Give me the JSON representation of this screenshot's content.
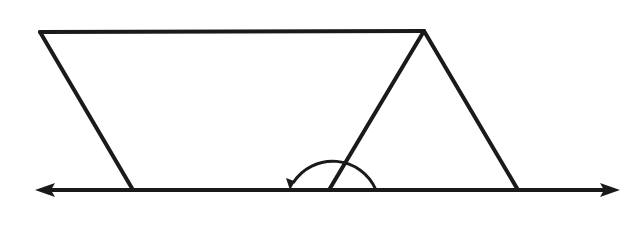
{
  "diagram": {
    "title": "",
    "stroke_color": "#1a1a1a",
    "background_color": "#ffffff",
    "stroke_width": 4,
    "baseline": {
      "type": "line-with-arrows-both-ends",
      "y": 190,
      "x_start": 35,
      "x_end": 620
    },
    "points": {
      "top_left": [
        40,
        32
      ],
      "top_right_apex": [
        424,
        31
      ],
      "base_left": [
        133,
        190
      ],
      "base_middle": [
        329,
        190
      ],
      "base_right": [
        518,
        190
      ]
    },
    "segments": [
      {
        "name": "top-edge",
        "from": "top_left",
        "to": "top_right_apex"
      },
      {
        "name": "left-edge",
        "from": "top_left",
        "to": "base_left"
      },
      {
        "name": "middle-edge",
        "from": "top_right_apex",
        "to": "base_middle"
      },
      {
        "name": "right-edge",
        "from": "top_right_apex",
        "to": "base_right"
      }
    ],
    "angle_marker": {
      "vertex": "base_middle",
      "radius": 47,
      "description": "obtuse angle arc from baseline (right) sweeping counter-clockwise to baseline (left) with arrowhead"
    },
    "labels": []
  }
}
